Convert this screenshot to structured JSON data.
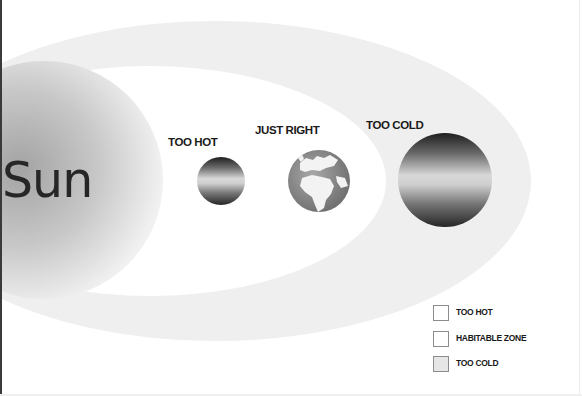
{
  "diagram": {
    "sun": {
      "label": "Sun"
    },
    "planets": [
      {
        "id": "too-hot",
        "label": "TOO HOT",
        "kind": "banded-planet"
      },
      {
        "id": "just-right",
        "label": "JUST RIGHT",
        "kind": "earth-globe"
      },
      {
        "id": "too-cold",
        "label": "TOO COLD",
        "kind": "banded-planet"
      }
    ],
    "zones": [
      {
        "id": "too-hot-zone",
        "description": "inner region around the sun"
      },
      {
        "id": "habitable-zone",
        "description": "white elliptical band"
      },
      {
        "id": "too-cold-zone",
        "description": "outer light gray elliptical band"
      }
    ]
  },
  "legend": {
    "items": [
      {
        "label": "TOO HOT",
        "swatch_color": "#ffffff"
      },
      {
        "label": "HABITABLE ZONE",
        "swatch_color": "#ffffff"
      },
      {
        "label": "TOO COLD",
        "swatch_color": "#e6e6e6"
      }
    ]
  },
  "colors": {
    "background": "#ffffff",
    "too_cold_band": "#efefef",
    "habitable_band": "#ffffff",
    "sun_center": "#9a9a9a",
    "sun_edge": "#f2f2f2",
    "text": "#1a1a1a"
  }
}
